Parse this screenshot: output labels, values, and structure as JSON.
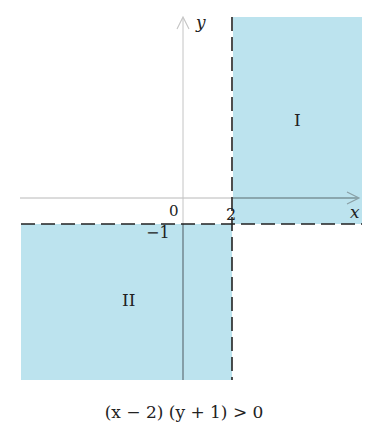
{
  "figure": {
    "caption": "(x − 2) (y + 1) > 0",
    "inequality": "(x - 2)(y + 1) > 0",
    "shade_color": "#bce3ee",
    "axis_color": "#b0b0b0",
    "boundary_color": "#222222"
  },
  "axes": {
    "x_label": "x",
    "y_label": "y",
    "origin_label": "0"
  },
  "boundaries": [
    {
      "name": "vertical",
      "equation": "x = 2",
      "style": "dashed",
      "tick_label": "2",
      "value": 2
    },
    {
      "name": "horizontal",
      "equation": "y = -1",
      "style": "dashed",
      "tick_label": "−1",
      "value": -1
    }
  ],
  "regions": [
    {
      "label": "I",
      "condition": "x > 2 and y > -1"
    },
    {
      "label": "II",
      "condition": "x < 2 and y < -1"
    }
  ]
}
